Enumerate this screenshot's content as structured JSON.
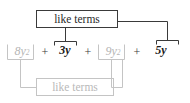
{
  "diagram": {
    "title_top": "like terms",
    "title_bottom": "like terms",
    "colors": {
      "dark": "#1a1a1a",
      "gray": "#b5b5b5",
      "box_dark_border": "#3a3a3a",
      "box_gray_border": "#c4c4c4",
      "line_dark": "#3a3a3a",
      "line_gray": "#c4c4c4",
      "background": "#ffffff"
    },
    "expression": "8y^2 + 3y + 9y^2 + 5y",
    "terms": [
      {
        "base": "8y",
        "exponent": "2",
        "style": "gray",
        "group": "bottom"
      },
      {
        "base": "3y",
        "exponent": "",
        "style": "dark",
        "group": "top"
      },
      {
        "base": "9y",
        "exponent": "2",
        "style": "gray",
        "group": "bottom"
      },
      {
        "base": "5y",
        "exponent": "",
        "style": "dark",
        "group": "top"
      }
    ],
    "operators": [
      "+",
      "+",
      "+"
    ]
  }
}
